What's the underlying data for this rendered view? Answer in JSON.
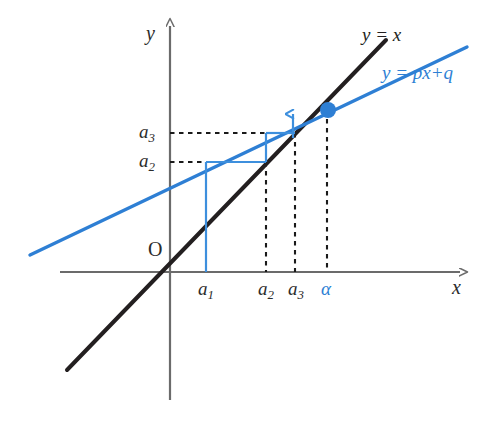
{
  "figure": {
    "kind": "cobweb-diagram",
    "background_color": "#ffffff",
    "axis_color": "#6b6b6b",
    "identity_line_color": "#231f20",
    "map_line_color": "#2e7fd4",
    "cobweb_color": "#3d8fdd",
    "dashed_color": "#1a1a1a",
    "fixed_point_color": "#2e7fd4"
  },
  "axes": {
    "x_label": "x",
    "y_label": "y",
    "origin_label": "O",
    "x_axis_y": 272,
    "y_axis_x": 170,
    "x_arrow_tip": 460,
    "y_arrow_tip": 26
  },
  "curve_labels": {
    "identity": {
      "text": "y = x",
      "color": "#231f20",
      "x": 362,
      "y": 24
    },
    "map": {
      "text": "y = px+q",
      "color": "#2e7fd4",
      "x": 382,
      "y": 62
    }
  },
  "x_ticks": [
    {
      "name": "a1",
      "base": "a",
      "sub": "1",
      "x": 206,
      "label_x": 198,
      "label_y": 278,
      "color": "#2b2b2b",
      "dashed": false
    },
    {
      "name": "a2",
      "base": "a",
      "sub": "2",
      "x": 266,
      "label_x": 258,
      "label_y": 278,
      "color": "#2b2b2b",
      "dashed": true
    },
    {
      "name": "a3",
      "base": "a",
      "sub": "3",
      "x": 295,
      "label_x": 288,
      "label_y": 278,
      "color": "#2b2b2b",
      "dashed": true
    },
    {
      "name": "alpha",
      "base": "α",
      "sub": "",
      "x": 327,
      "label_x": 321,
      "label_y": 278,
      "color": "#2e7fd4",
      "dashed": true
    }
  ],
  "y_ticks": [
    {
      "name": "a3",
      "base": "a",
      "sub": "3",
      "y": 133,
      "label_x": 139,
      "label_y": 121,
      "color": "#2b2b2b"
    },
    {
      "name": "a2",
      "base": "a",
      "sub": "2",
      "y": 162,
      "label_x": 139,
      "label_y": 150,
      "color": "#2b2b2b"
    }
  ],
  "lines": {
    "identity": {
      "x1": 67,
      "y1": 370,
      "x2": 386,
      "y2": 40,
      "width": 4
    },
    "map": {
      "x1": 30,
      "y1": 255,
      "x2": 467,
      "y2": 47,
      "width": 3.4
    }
  },
  "fixed_point": {
    "x": 328,
    "y": 110,
    "radius": 8
  },
  "cobweb": {
    "segments": [
      {
        "type": "vertical",
        "x": 206,
        "y1": 272,
        "y2": 162
      },
      {
        "type": "horizontal",
        "y": 162,
        "x1": 206,
        "x2": 266
      },
      {
        "type": "vertical",
        "x": 266,
        "y1": 162,
        "y2": 133
      },
      {
        "type": "horizontal",
        "y": 133,
        "x1": 266,
        "x2": 295
      },
      {
        "type": "vertical-arrow",
        "x": 293,
        "y1": 138,
        "y2": 114
      }
    ]
  },
  "dashed_guides": {
    "verticals": [
      {
        "x": 266,
        "y1": 162,
        "y2": 272
      },
      {
        "x": 295,
        "y1": 133,
        "y2": 272
      },
      {
        "x": 327,
        "y1": 110,
        "y2": 272
      }
    ],
    "horizontals": [
      {
        "y": 133,
        "x1": 170,
        "x2": 268
      },
      {
        "y": 162,
        "x1": 170,
        "x2": 208
      }
    ]
  }
}
